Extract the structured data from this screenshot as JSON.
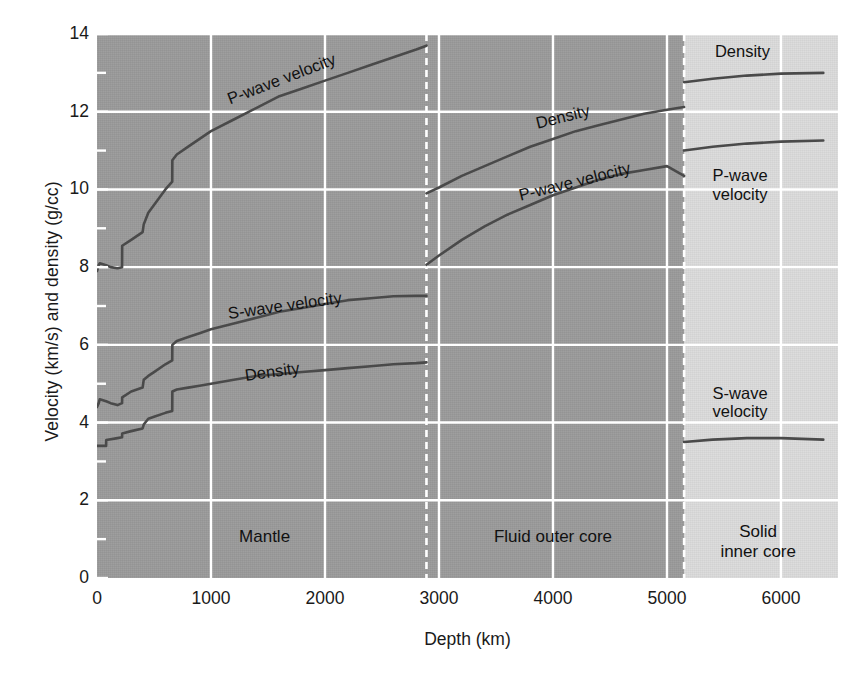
{
  "chart_data": {
    "type": "line",
    "title": "",
    "xlabel": "Depth (km)",
    "ylabel": "Velocity (km/s) and density (g/cc)",
    "xlim": [
      0,
      6500
    ],
    "ylim": [
      0,
      14
    ],
    "xticks": [
      0,
      1000,
      2000,
      3000,
      4000,
      5000,
      6000
    ],
    "xticklabels": [
      "0",
      "1000",
      "2000",
      "3000",
      "4000",
      "5000",
      "6000"
    ],
    "yticks": [
      0,
      2,
      4,
      6,
      8,
      10,
      12,
      14
    ],
    "yticklabels": [
      "0",
      "2",
      "4",
      "6",
      "8",
      "10",
      "12",
      "14"
    ],
    "yminorticks": [
      1,
      3,
      5,
      7,
      9,
      11,
      13
    ],
    "grid": true,
    "grid_color": "#ffffff",
    "legend_position": "inline-annotations",
    "line_color": "#4a4a4a",
    "regions": [
      {
        "name": "Mantle",
        "label": "Mantle",
        "x_start": 0,
        "x_end": 2890,
        "shade": "#9b9b9b"
      },
      {
        "name": "Fluid outer core",
        "label": "Fluid outer core",
        "x_start": 2890,
        "x_end": 5150,
        "shade": "#9b9b9b"
      },
      {
        "name": "Solid inner core",
        "label": "Solid\ninner core",
        "x_start": 5150,
        "x_end": 6371,
        "shade": "#dcdcdc"
      }
    ],
    "boundaries": [
      {
        "name": "core-mantle-boundary",
        "depth": 2890,
        "style": "dashed"
      },
      {
        "name": "inner-core-boundary",
        "depth": 5150,
        "style": "dashed"
      }
    ],
    "series": [
      {
        "name": "P-wave velocity",
        "segments": [
          {
            "region": "Mantle",
            "points": [
              [
                0,
                7.9
              ],
              [
                15,
                8.05
              ],
              [
                24,
                8.1
              ],
              [
                80,
                8.05
              ],
              [
                120,
                8.0
              ],
              [
                180,
                7.97
              ],
              [
                220,
                8.0
              ],
              [
                221,
                8.55
              ],
              [
                300,
                8.7
              ],
              [
                400,
                8.9
              ],
              [
                410,
                9.1
              ],
              [
                450,
                9.4
              ],
              [
                500,
                9.6
              ],
              [
                600,
                10.0
              ],
              [
                660,
                10.2
              ],
              [
                661,
                10.75
              ],
              [
                700,
                10.9
              ],
              [
                800,
                11.1
              ],
              [
                900,
                11.3
              ],
              [
                1000,
                11.5
              ],
              [
                1200,
                11.8
              ],
              [
                1400,
                12.1
              ],
              [
                1600,
                12.4
              ],
              [
                1800,
                12.6
              ],
              [
                2000,
                12.8
              ],
              [
                2200,
                13.0
              ],
              [
                2400,
                13.2
              ],
              [
                2600,
                13.4
              ],
              [
                2800,
                13.6
              ],
              [
                2890,
                13.7
              ]
            ]
          },
          {
            "region": "Fluid outer core",
            "points": [
              [
                2890,
                8.06
              ],
              [
                3000,
                8.3
              ],
              [
                3200,
                8.7
              ],
              [
                3400,
                9.05
              ],
              [
                3600,
                9.35
              ],
              [
                3800,
                9.6
              ],
              [
                4000,
                9.85
              ],
              [
                4200,
                10.05
              ],
              [
                4400,
                10.25
              ],
              [
                4600,
                10.4
              ],
              [
                4800,
                10.5
              ],
              [
                5000,
                10.6
              ],
              [
                5150,
                10.35
              ]
            ]
          },
          {
            "region": "Solid inner core",
            "points": [
              [
                5150,
                11.0
              ],
              [
                5400,
                11.1
              ],
              [
                5700,
                11.18
              ],
              [
                6000,
                11.23
              ],
              [
                6371,
                11.26
              ]
            ]
          }
        ]
      },
      {
        "name": "S-wave velocity",
        "segments": [
          {
            "region": "Mantle",
            "points": [
              [
                0,
                4.4
              ],
              [
                15,
                4.5
              ],
              [
                24,
                4.6
              ],
              [
                80,
                4.55
              ],
              [
                120,
                4.5
              ],
              [
                180,
                4.45
              ],
              [
                220,
                4.5
              ],
              [
                221,
                4.65
              ],
              [
                300,
                4.8
              ],
              [
                400,
                4.9
              ],
              [
                410,
                5.1
              ],
              [
                450,
                5.2
              ],
              [
                500,
                5.3
              ],
              [
                600,
                5.5
              ],
              [
                660,
                5.6
              ],
              [
                661,
                6.0
              ],
              [
                700,
                6.1
              ],
              [
                800,
                6.2
              ],
              [
                900,
                6.3
              ],
              [
                1000,
                6.4
              ],
              [
                1200,
                6.55
              ],
              [
                1400,
                6.7
              ],
              [
                1600,
                6.85
              ],
              [
                1800,
                6.95
              ],
              [
                2000,
                7.05
              ],
              [
                2200,
                7.15
              ],
              [
                2400,
                7.2
              ],
              [
                2600,
                7.25
              ],
              [
                2800,
                7.26
              ],
              [
                2890,
                7.26
              ]
            ]
          },
          {
            "region": "Solid inner core",
            "points": [
              [
                5150,
                3.5
              ],
              [
                5400,
                3.56
              ],
              [
                5700,
                3.6
              ],
              [
                6000,
                3.6
              ],
              [
                6371,
                3.56
              ]
            ]
          }
        ]
      },
      {
        "name": "Density",
        "segments": [
          {
            "region": "Mantle",
            "points": [
              [
                0,
                3.4
              ],
              [
                80,
                3.4
              ],
              [
                81,
                3.55
              ],
              [
                180,
                3.6
              ],
              [
                220,
                3.62
              ],
              [
                221,
                3.72
              ],
              [
                300,
                3.78
              ],
              [
                400,
                3.85
              ],
              [
                410,
                3.95
              ],
              [
                450,
                4.1
              ],
              [
                500,
                4.15
              ],
              [
                600,
                4.25
              ],
              [
                660,
                4.3
              ],
              [
                661,
                4.8
              ],
              [
                700,
                4.85
              ],
              [
                800,
                4.9
              ],
              [
                900,
                4.95
              ],
              [
                1000,
                5.0
              ],
              [
                1200,
                5.1
              ],
              [
                1400,
                5.2
              ],
              [
                1600,
                5.25
              ],
              [
                1800,
                5.3
              ],
              [
                2000,
                5.35
              ],
              [
                2200,
                5.4
              ],
              [
                2400,
                5.45
              ],
              [
                2600,
                5.5
              ],
              [
                2800,
                5.53
              ],
              [
                2890,
                5.55
              ]
            ]
          },
          {
            "region": "Fluid outer core",
            "points": [
              [
                2890,
                9.9
              ],
              [
                3000,
                10.05
              ],
              [
                3200,
                10.35
              ],
              [
                3400,
                10.6
              ],
              [
                3600,
                10.85
              ],
              [
                3800,
                11.1
              ],
              [
                4000,
                11.3
              ],
              [
                4200,
                11.5
              ],
              [
                4400,
                11.65
              ],
              [
                4600,
                11.8
              ],
              [
                4800,
                11.95
              ],
              [
                5000,
                12.05
              ],
              [
                5150,
                12.12
              ]
            ]
          },
          {
            "region": "Solid inner core",
            "points": [
              [
                5150,
                12.76
              ],
              [
                5400,
                12.85
              ],
              [
                5700,
                12.93
              ],
              [
                6000,
                12.98
              ],
              [
                6371,
                13.0
              ]
            ]
          }
        ]
      }
    ],
    "annotations": [
      {
        "name": "p-wave-mantle",
        "text": "P-wave velocity",
        "depth": 1150,
        "value": 12.55,
        "rotation": -21
      },
      {
        "name": "s-wave-mantle",
        "text": "S-wave velocity",
        "depth": 1150,
        "value": 7.05,
        "rotation": -8
      },
      {
        "name": "density-mantle",
        "text": "Density",
        "depth": 1300,
        "value": 5.45,
        "rotation": -8
      },
      {
        "name": "density-outer-core",
        "text": "Density",
        "depth": 3850,
        "value": 11.95,
        "rotation": -14
      },
      {
        "name": "p-wave-outer-core",
        "text": "P-wave velocity",
        "depth": 3700,
        "value": 10.1,
        "rotation": -14
      },
      {
        "name": "density-inner-core",
        "text": "Density",
        "depth": 5420,
        "value": 13.8,
        "rotation": 0
      },
      {
        "name": "p-wave-inner-core",
        "text": "P-wave\nvelocity",
        "depth": 5400,
        "value": 10.6,
        "rotation": 0
      },
      {
        "name": "s-wave-inner-core",
        "text": "S-wave\nvelocity",
        "depth": 5400,
        "value": 5.0,
        "rotation": 0
      }
    ],
    "region_labels": [
      {
        "name": "mantle",
        "text": "Mantle",
        "depth": 1470,
        "value": 1.3
      },
      {
        "name": "fluid-outer-core",
        "text": "Fluid outer core",
        "depth": 4000,
        "value": 1.3
      },
      {
        "name": "solid-inner-core",
        "text": "Solid\ninner core",
        "depth": 5800,
        "value": 1.45
      }
    ]
  }
}
